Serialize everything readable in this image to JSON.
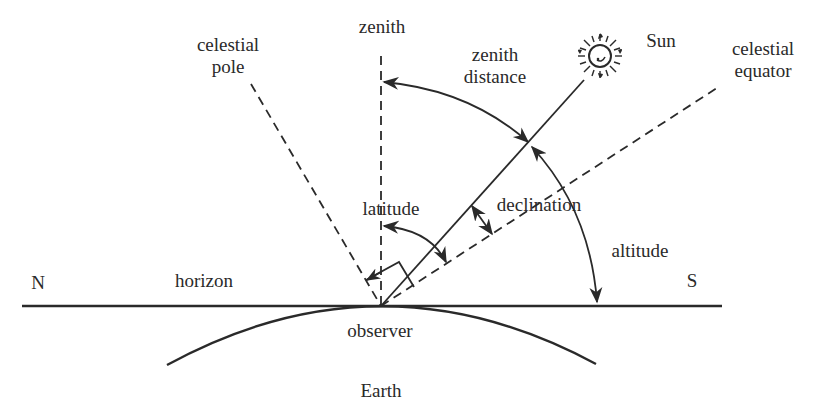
{
  "diagram": {
    "colors": {
      "ink": "#2a2a2a",
      "background": "#ffffff"
    },
    "labels": {
      "zenith": "zenith",
      "celestial_pole": "celestial\npole",
      "zenith_distance": "zenith\ndistance",
      "sun": "Sun",
      "celestial_equator": "celestial\nequator",
      "latitude": "latitude",
      "declination": "declination",
      "altitude": "altitude",
      "north": "N",
      "south": "S",
      "horizon": "horizon",
      "observer": "observer",
      "earth": "Earth"
    },
    "elements": [
      {
        "name": "horizon-line",
        "style": "solid"
      },
      {
        "name": "zenith-line",
        "style": "dashed"
      },
      {
        "name": "celestial-pole-line",
        "style": "dashed"
      },
      {
        "name": "sun-direction-line",
        "style": "solid"
      },
      {
        "name": "celestial-equator-line",
        "style": "dashed"
      },
      {
        "name": "earth-surface-arc",
        "style": "solid"
      },
      {
        "name": "zenith-distance-arc",
        "style": "double-arrow"
      },
      {
        "name": "altitude-arc",
        "style": "arrow"
      },
      {
        "name": "latitude-arc",
        "style": "double-arrow"
      },
      {
        "name": "declination-arrow",
        "style": "double-arrow"
      },
      {
        "name": "right-angle-marker",
        "style": "solid"
      },
      {
        "name": "sun-icon",
        "style": "glyph"
      }
    ]
  }
}
